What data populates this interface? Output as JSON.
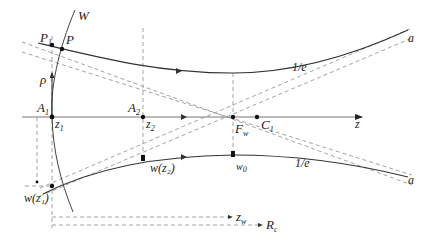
{
  "diagram": {
    "type": "gaussian-beam-propagation",
    "axis": {
      "label": "z"
    },
    "wavefront": {
      "label": "W"
    },
    "points": {
      "P1": {
        "main": "P",
        "sub": "1"
      },
      "P": {
        "main": "P"
      },
      "rho": {
        "main": "ρ"
      },
      "A1": {
        "main": "A",
        "sub": "1"
      },
      "z1": {
        "main": "z",
        "sub": "1"
      },
      "A2": {
        "main": "A",
        "sub": "2"
      },
      "z2": {
        "main": "z",
        "sub": "2"
      },
      "Fw": {
        "main": "F",
        "sub": "w"
      },
      "C1": {
        "main": "C",
        "sub": "1"
      }
    },
    "beam_labels": {
      "upper_level": "1/e",
      "lower_level": "1/e",
      "upper_end": "a",
      "lower_end": "a"
    },
    "widths": {
      "w_z1": "w(z₁)",
      "w_z2": "w(z₂)",
      "w0": {
        "main": "w",
        "sub": "0"
      }
    },
    "distances": {
      "zw": {
        "main": "z",
        "sub": "w"
      },
      "Rc": {
        "main": "R",
        "sub": "c"
      }
    },
    "colors": {
      "beam": "#333333",
      "axis": "#777777",
      "dashed": "#999999",
      "text": "#222222"
    }
  }
}
